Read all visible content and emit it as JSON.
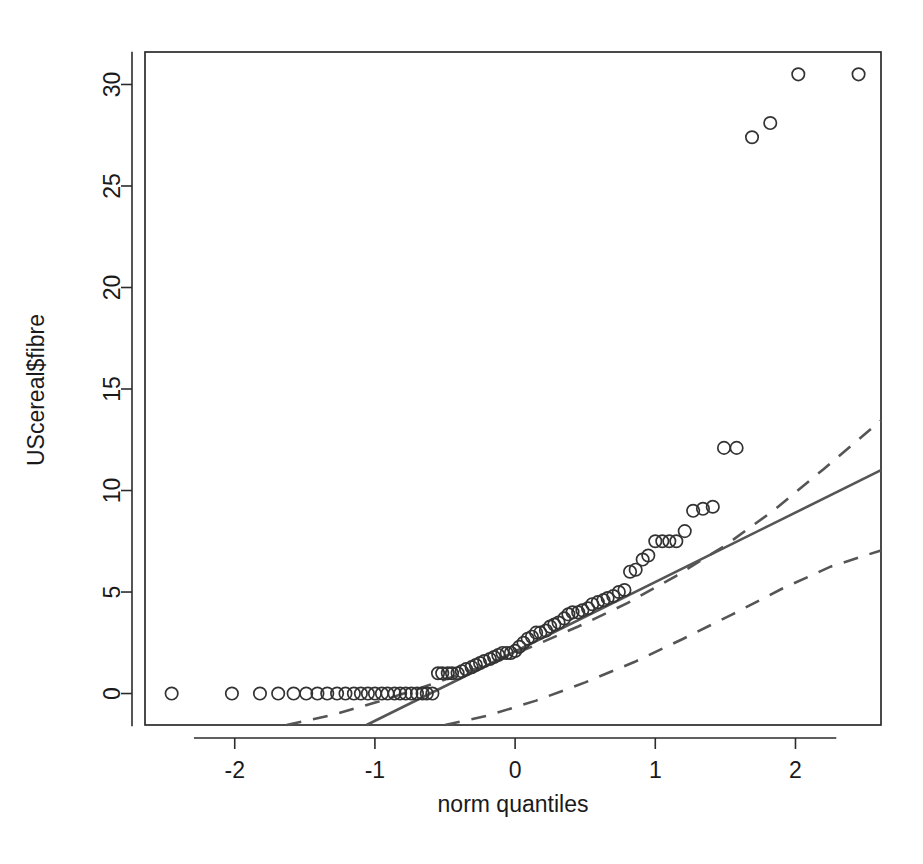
{
  "figure": {
    "kind": "qq-plot",
    "background_color": "#ffffff",
    "width": 923,
    "height": 864
  },
  "axes": {
    "x_title": "norm quantiles",
    "y_title": "UScereal$fibre",
    "x_ticks": [
      "-2",
      "-1",
      "0",
      "1",
      "2"
    ],
    "y_ticks": [
      "0",
      "5",
      "10",
      "15",
      "20",
      "25",
      "30"
    ]
  },
  "style": {
    "point_color": "#333333",
    "line_color": "#555555",
    "axis_color": "#2b2b2b",
    "text_color": "#1a1a1a"
  },
  "chart_data": {
    "type": "scatter",
    "title": "",
    "subtitle": "",
    "xlabel": "norm quantiles",
    "ylabel": "UScereal$fibre",
    "xlim": [
      -2.64,
      2.61
    ],
    "ylim": [
      -1.55,
      31.6
    ],
    "xticks": [
      -2,
      -1,
      0,
      1,
      2
    ],
    "yticks": [
      0,
      5,
      10,
      15,
      20,
      25,
      30
    ],
    "grid": false,
    "legend": null,
    "annotations": [],
    "series": [
      {
        "name": "sample quantiles",
        "marker": "open-circle",
        "x": [
          -2.45,
          -2.02,
          -1.82,
          -1.69,
          -1.58,
          -1.49,
          -1.41,
          -1.34,
          -1.27,
          -1.21,
          -1.15,
          -1.1,
          -1.05,
          -1.0,
          -0.95,
          -0.91,
          -0.86,
          -0.82,
          -0.78,
          -0.74,
          -0.7,
          -0.66,
          -0.63,
          -0.59,
          -0.55,
          -0.52,
          -0.48,
          -0.45,
          -0.41,
          -0.38,
          -0.35,
          -0.31,
          -0.28,
          -0.25,
          -0.22,
          -0.18,
          -0.15,
          -0.12,
          -0.09,
          -0.06,
          -0.03,
          0.0,
          0.03,
          0.06,
          0.09,
          0.12,
          0.15,
          0.18,
          0.22,
          0.25,
          0.28,
          0.31,
          0.35,
          0.38,
          0.41,
          0.45,
          0.48,
          0.52,
          0.55,
          0.59,
          0.63,
          0.66,
          0.7,
          0.74,
          0.78,
          0.82,
          0.86,
          0.91,
          0.95,
          1.0,
          1.05,
          1.1,
          1.15,
          1.21,
          1.27,
          1.34,
          1.41,
          1.49,
          1.58,
          1.69,
          1.82,
          2.02,
          2.45
        ],
        "y": [
          0.0,
          0.0,
          0.0,
          0.0,
          0.0,
          0.0,
          0.0,
          0.0,
          0.0,
          0.0,
          0.0,
          0.0,
          0.0,
          0.0,
          0.0,
          0.0,
          0.0,
          0.0,
          0.0,
          0.0,
          0.0,
          0.0,
          0.0,
          0.0,
          1.0,
          1.0,
          1.0,
          1.0,
          1.0,
          1.1,
          1.2,
          1.3,
          1.4,
          1.5,
          1.6,
          1.7,
          1.8,
          1.9,
          2.0,
          2.0,
          2.0,
          2.1,
          2.3,
          2.5,
          2.7,
          2.8,
          3.0,
          3.0,
          3.1,
          3.3,
          3.4,
          3.5,
          3.7,
          3.9,
          4.0,
          4.0,
          4.1,
          4.2,
          4.4,
          4.5,
          4.6,
          4.7,
          4.8,
          5.0,
          5.1,
          6.0,
          6.1,
          6.6,
          6.8,
          7.5,
          7.5,
          7.5,
          7.5,
          8.0,
          9.0,
          9.1,
          9.2,
          12.1,
          12.1,
          27.4,
          28.1,
          30.5,
          30.5
        ]
      },
      {
        "name": "reference line",
        "style": "solid",
        "x": [
          -1.06,
          2.61
        ],
        "y": [
          -1.55,
          11.0
        ]
      },
      {
        "name": "upper confidence band",
        "style": "dashed",
        "x": [
          -1.63,
          -1.3,
          -0.95,
          -0.6,
          -0.25,
          0.1,
          0.45,
          0.8,
          1.15,
          1.5,
          1.85,
          2.2,
          2.61
        ],
        "y": [
          -1.55,
          -1.05,
          -0.35,
          0.45,
          1.3,
          2.25,
          3.3,
          4.45,
          5.8,
          7.3,
          9.05,
          11.05,
          13.45
        ]
      },
      {
        "name": "lower confidence band",
        "style": "dashed",
        "x": [
          -0.5,
          -0.2,
          0.15,
          0.5,
          0.85,
          1.2,
          1.55,
          1.9,
          2.25,
          2.61
        ],
        "y": [
          -1.55,
          -1.1,
          -0.35,
          0.55,
          1.55,
          2.7,
          3.9,
          5.15,
          6.25,
          7.05
        ]
      }
    ]
  }
}
